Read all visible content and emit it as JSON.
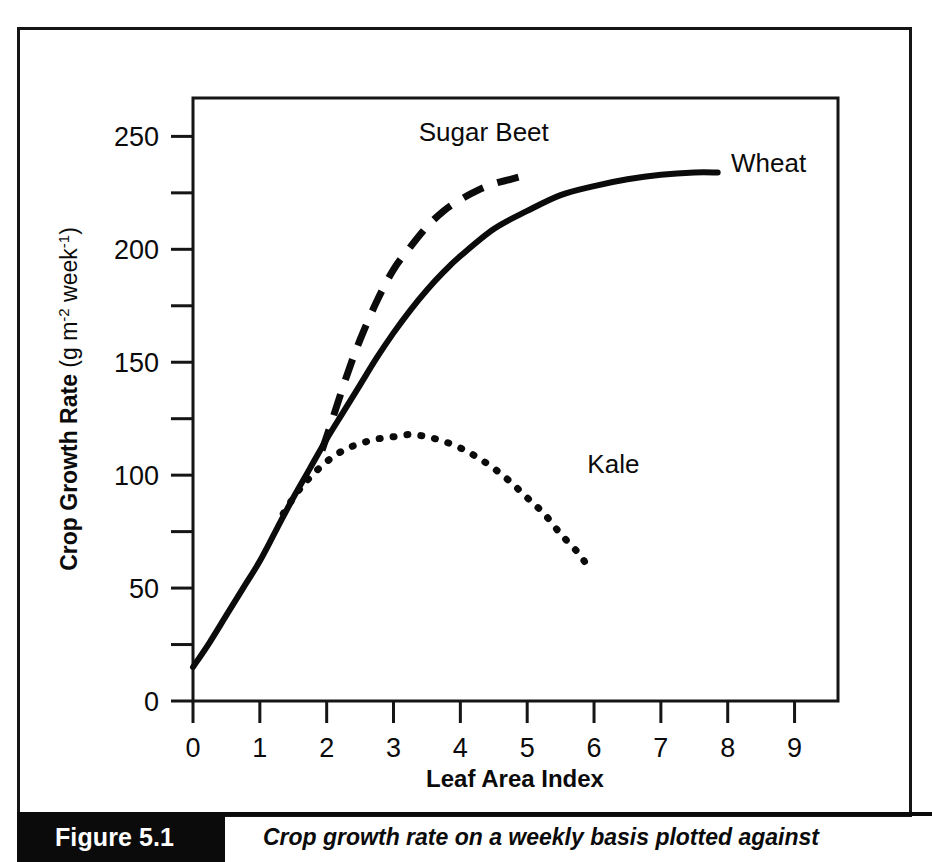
{
  "figure": {
    "number_label": "Figure 5.1",
    "caption": "Crop growth rate on a weekly basis plotted against"
  },
  "chart_data": {
    "type": "line",
    "title": "",
    "xlabel": "Leaf Area Index",
    "ylabel": "Crop Growth Rate (g m-2 week-1)",
    "ylabel_main": "Crop Growth Rate",
    "ylabel_units": "(g m",
    "ylabel_units_exp1": "-2",
    "ylabel_units_mid": " week",
    "ylabel_units_exp2": "-1",
    "ylabel_units_end": ")",
    "xlim": [
      0,
      9.65
    ],
    "ylim": [
      0,
      267
    ],
    "xticks": [
      0,
      1,
      2,
      3,
      4,
      5,
      6,
      7,
      8,
      9
    ],
    "xticklabels": [
      "0",
      "1",
      "2",
      "3",
      "4",
      "5",
      "6",
      "7",
      "8",
      "9"
    ],
    "yticks": [
      0,
      50,
      100,
      150,
      200,
      250
    ],
    "yticklabels": [
      "0",
      "50",
      "100",
      "150",
      "200",
      "250"
    ],
    "yminorticks": [
      25,
      75,
      125,
      175,
      225
    ],
    "grid": false,
    "legend_position": "inline-annotations",
    "series": [
      {
        "name": "Wheat",
        "style": "solid",
        "label_x": 8.05,
        "label_y": 238,
        "points": [
          [
            0.0,
            15
          ],
          [
            0.25,
            26
          ],
          [
            0.5,
            38
          ],
          [
            0.75,
            50
          ],
          [
            1.0,
            62
          ],
          [
            1.25,
            76
          ],
          [
            1.5,
            90
          ],
          [
            1.75,
            103
          ],
          [
            2.0,
            116
          ],
          [
            2.25,
            128
          ],
          [
            2.5,
            140
          ],
          [
            2.75,
            152
          ],
          [
            3.0,
            163
          ],
          [
            3.25,
            173
          ],
          [
            3.5,
            182
          ],
          [
            3.75,
            190
          ],
          [
            4.0,
            197
          ],
          [
            4.5,
            209
          ],
          [
            5.0,
            217
          ],
          [
            5.5,
            224
          ],
          [
            6.0,
            228
          ],
          [
            6.5,
            231
          ],
          [
            7.0,
            233
          ],
          [
            7.5,
            234
          ],
          [
            7.85,
            234
          ]
        ]
      },
      {
        "name": "Sugar Beet",
        "style": "dashed",
        "label_x": 4.35,
        "label_y": 252,
        "points": [
          [
            1.93,
            111
          ],
          [
            2.1,
            126
          ],
          [
            2.3,
            144
          ],
          [
            2.5,
            160
          ],
          [
            2.75,
            177
          ],
          [
            3.0,
            191
          ],
          [
            3.25,
            201
          ],
          [
            3.5,
            210
          ],
          [
            3.75,
            217
          ],
          [
            4.0,
            222
          ],
          [
            4.25,
            226
          ],
          [
            4.5,
            229
          ],
          [
            4.75,
            231
          ],
          [
            5.0,
            233
          ]
        ]
      },
      {
        "name": "Kale",
        "style": "dotted",
        "label_x": 5.9,
        "label_y": 105,
        "points": [
          [
            1.35,
            83
          ],
          [
            1.55,
            92
          ],
          [
            1.75,
            99
          ],
          [
            2.0,
            106
          ],
          [
            2.25,
            111
          ],
          [
            2.5,
            114
          ],
          [
            2.75,
            116
          ],
          [
            3.0,
            117
          ],
          [
            3.25,
            118
          ],
          [
            3.5,
            117
          ],
          [
            3.75,
            115
          ],
          [
            4.0,
            112
          ],
          [
            4.25,
            108
          ],
          [
            4.5,
            103
          ],
          [
            4.75,
            97
          ],
          [
            5.0,
            90
          ],
          [
            5.25,
            83
          ],
          [
            5.5,
            74
          ],
          [
            5.75,
            66
          ],
          [
            5.9,
            60
          ]
        ]
      }
    ]
  }
}
